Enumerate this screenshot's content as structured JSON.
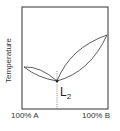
{
  "diagram": {
    "type": "binary-eutectic-phase-diagram",
    "y_axis_label": "Temperature",
    "x_axis_left_label": "100% A",
    "x_axis_right_label": "100% B",
    "eutectic_label": "L",
    "eutectic_label_subscript": "2",
    "line_color": "#333333"
  }
}
